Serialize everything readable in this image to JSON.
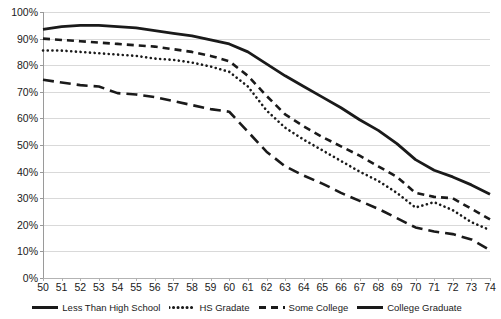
{
  "chart_data": {
    "type": "line",
    "title": "",
    "xlabel": "",
    "ylabel": "",
    "xlim": [
      50,
      74
    ],
    "ylim": [
      0,
      100
    ],
    "grid": true,
    "legend_position": "bottom",
    "x": [
      50,
      51,
      52,
      53,
      54,
      55,
      56,
      57,
      58,
      59,
      60,
      61,
      62,
      63,
      64,
      65,
      66,
      67,
      68,
      69,
      70,
      71,
      72,
      73,
      74
    ],
    "y_ticks": [
      "0%",
      "10%",
      "20%",
      "30%",
      "40%",
      "50%",
      "60%",
      "70%",
      "80%",
      "90%",
      "100%"
    ],
    "y_tick_values": [
      0,
      10,
      20,
      30,
      40,
      50,
      60,
      70,
      80,
      90,
      100
    ],
    "x_ticks": [
      "50",
      "51",
      "52",
      "53",
      "54",
      "55",
      "56",
      "57",
      "58",
      "59",
      "60",
      "61",
      "62",
      "63",
      "64",
      "65",
      "66",
      "67",
      "68",
      "69",
      "70",
      "71",
      "72",
      "73",
      "74"
    ],
    "series": [
      {
        "name": "Less Than High School",
        "dash": "long-dash",
        "color": "#1a1a1a",
        "width": 2.6,
        "values": [
          74.5,
          73.5,
          72.5,
          72.0,
          69.5,
          69.0,
          68.0,
          66.5,
          65.0,
          63.5,
          62.5,
          55.0,
          47.5,
          42.0,
          38.5,
          35.5,
          32.0,
          29.0,
          26.0,
          22.5,
          19.0,
          17.5,
          16.5,
          14.5,
          10.5
        ]
      },
      {
        "name": "HS Gradate",
        "dash": "dotted",
        "color": "#1a1a1a",
        "width": 2.6,
        "values": [
          85.5,
          85.5,
          85.0,
          84.5,
          84.0,
          83.5,
          82.5,
          82.0,
          81.0,
          79.5,
          77.5,
          72.0,
          63.0,
          56.5,
          52.0,
          48.0,
          44.0,
          40.0,
          36.5,
          32.0,
          26.5,
          28.5,
          25.5,
          21.0,
          18.0
        ]
      },
      {
        "name": "Some College",
        "dash": "medium-dash",
        "color": "#1a1a1a",
        "width": 2.6,
        "values": [
          90.0,
          89.5,
          89.0,
          88.5,
          88.0,
          87.5,
          87.0,
          86.0,
          85.0,
          83.5,
          81.5,
          76.0,
          68.5,
          61.5,
          57.0,
          53.0,
          49.5,
          46.0,
          42.0,
          38.0,
          32.0,
          30.5,
          30.0,
          26.0,
          22.0
        ]
      },
      {
        "name": "College Graduate",
        "dash": "solid",
        "color": "#1a1a1a",
        "width": 2.8,
        "values": [
          93.5,
          94.5,
          95.0,
          95.0,
          94.5,
          94.0,
          93.0,
          92.0,
          91.0,
          89.5,
          88.0,
          85.0,
          80.5,
          76.0,
          72.0,
          68.0,
          64.0,
          59.5,
          55.5,
          50.5,
          44.5,
          40.5,
          38.0,
          35.0,
          31.5
        ]
      }
    ]
  },
  "legend": {
    "items": [
      {
        "label": "Less Than High School",
        "swatch": "long-dash-swatch"
      },
      {
        "label": "HS Gradate",
        "swatch": "dotted-swatch"
      },
      {
        "label": "Some College",
        "swatch": "medium-dash-swatch"
      },
      {
        "label": "College Graduate",
        "swatch": "solid-swatch"
      }
    ]
  }
}
